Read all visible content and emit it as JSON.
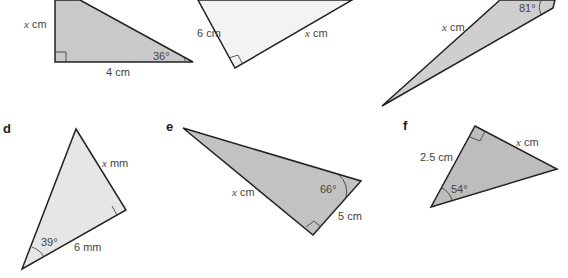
{
  "figures": [
    {
      "id": "a",
      "part_label": "",
      "labels": {
        "side_vertical": "x cm",
        "side_base": "4 cm",
        "angle": "36°"
      },
      "fill": "#c9c9c9"
    },
    {
      "id": "b",
      "part_label": "",
      "labels": {
        "side_left": "6 cm",
        "side_hyp": "x cm",
        "angle_top": "25°"
      },
      "fill": "#f3f3f3"
    },
    {
      "id": "c",
      "part_label": "",
      "labels": {
        "side_long": "x cm",
        "angle": "81°"
      },
      "fill": "#cfcfcf"
    },
    {
      "id": "d",
      "part_label": "d",
      "labels": {
        "side_right": "x mm",
        "side_base": "6 mm",
        "angle": "39°"
      },
      "fill": "#e6e6e6"
    },
    {
      "id": "e",
      "part_label": "e",
      "labels": {
        "side_left": "x cm",
        "side_right": "5 cm",
        "angle": "66°"
      },
      "fill": "#c2c2c2"
    },
    {
      "id": "f",
      "part_label": "f",
      "labels": {
        "side_left": "2.5 cm",
        "side_right": "x cm",
        "angle": "54°"
      },
      "fill": "#bdbdbd"
    }
  ],
  "text": {
    "a_x": "x",
    "a_x_unit": "cm",
    "a_base": "4 cm",
    "a_angle": "36°",
    "b_left": "6 cm",
    "b_x": "x",
    "b_x_unit": "cm",
    "c_x": "x",
    "c_x_unit": "cm",
    "c_angle": "81°",
    "d_label": "d",
    "d_x": "x",
    "d_x_unit": "mm",
    "d_base": "6 mm",
    "d_angle": "39°",
    "e_label": "e",
    "e_x": "x",
    "e_x_unit": "cm",
    "e_side": "5 cm",
    "e_angle": "66°",
    "f_label": "f",
    "f_left": "2.5 cm",
    "f_x": "x",
    "f_x_unit": "cm",
    "f_angle": "54°"
  }
}
